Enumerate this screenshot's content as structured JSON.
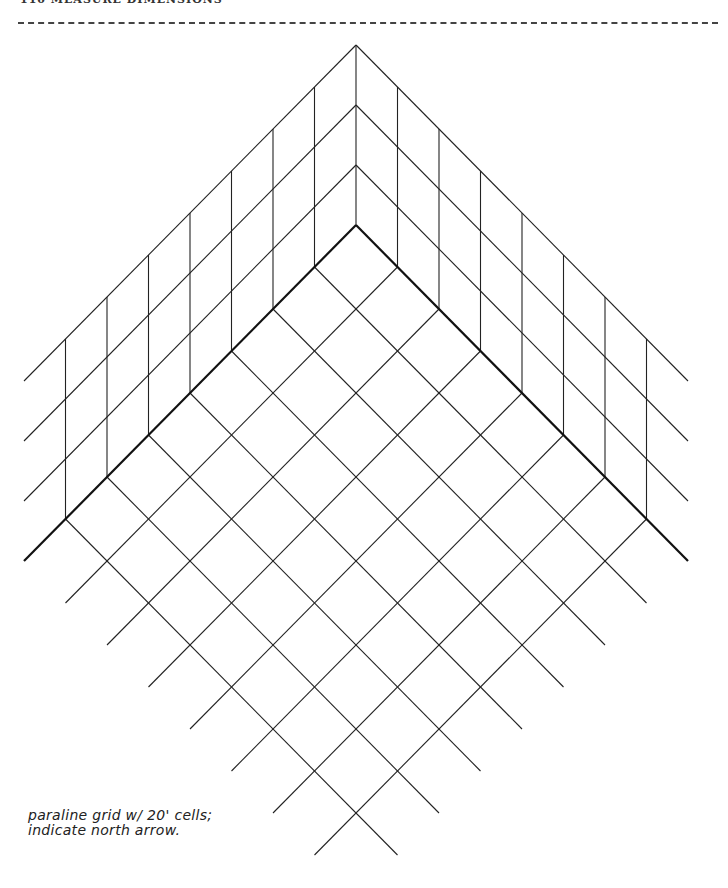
{
  "header": {
    "title": "110 MEASURE DIMENSIONS"
  },
  "drawing": {
    "type": "paraline grid",
    "floor_cells_per_side": 7,
    "wall_levels": 3,
    "line_color": "#222222",
    "edge_color": "#111111"
  },
  "note": {
    "line1": "paraline grid w/ 20' cells;",
    "line2": "indicate north arrow."
  }
}
